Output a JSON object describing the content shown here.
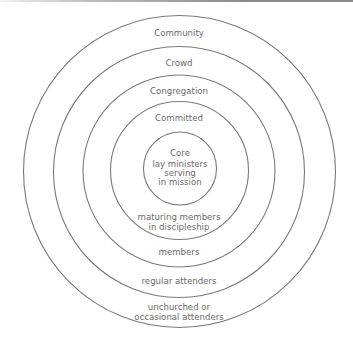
{
  "diagram": {
    "type": "concentric-circles",
    "line_color": "#7a7a7a",
    "text_color": "#6a6a6a",
    "rings": [
      {
        "id": "community",
        "cx": 179.5,
        "cy": 171.5,
        "r": 156
      },
      {
        "id": "crowd",
        "cx": 179,
        "cy": 172,
        "r": 125.5
      },
      {
        "id": "congregation",
        "cx": 179,
        "cy": 171,
        "r": 96
      },
      {
        "id": "committed",
        "cx": 179.5,
        "cy": 170.5,
        "r": 69
      },
      {
        "id": "core",
        "cx": 180,
        "cy": 168.5,
        "r": 36.5
      }
    ],
    "top_labels": {
      "community": "Community",
      "crowd": "Crowd",
      "congregation": "Congregation",
      "committed": "Committed"
    },
    "core_label": {
      "line1": "Core",
      "line2": "lay ministers",
      "line3": "serving",
      "line4": "in mission"
    },
    "bottom_labels": {
      "committed_line1": "maturing members",
      "committed_line2": "in discipleship",
      "congregation": "members",
      "crowd": "regular attenders",
      "community_line1": "unchurched or",
      "community_line2": "occasional attenders"
    }
  }
}
